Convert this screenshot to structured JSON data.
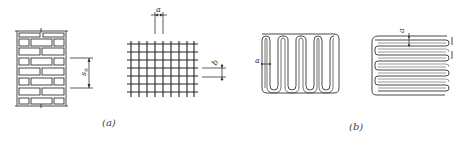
{
  "figure": {
    "panels": [
      {
        "id": "a",
        "caption": "(a)",
        "drawings": [
          {
            "name": "brick-wall",
            "dimension_label": "s_n",
            "dimension_label_main": "s",
            "dimension_label_sub": "n"
          },
          {
            "name": "wire-mesh-grid",
            "dimension_labels": {
              "top": "a",
              "right": "b"
            }
          }
        ]
      },
      {
        "id": "b",
        "caption": "(b)",
        "drawings": [
          {
            "name": "vertical-serpentine-reinforcement",
            "dimension_label": "a"
          },
          {
            "name": "horizontal-serpentine-reinforcement",
            "dimension_label": "a"
          }
        ]
      }
    ]
  },
  "colors": {
    "line": "#333333",
    "background": "#ffffff"
  }
}
